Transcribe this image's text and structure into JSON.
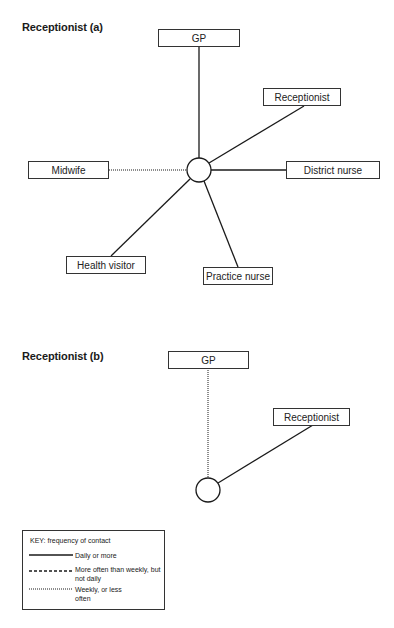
{
  "diagrams": [
    {
      "title": "Receptionist (a)",
      "nodes": [
        {
          "id": "gp",
          "label": "GP",
          "contact": "daily"
        },
        {
          "id": "receptionist",
          "label": "Receptionist",
          "contact": "daily"
        },
        {
          "id": "district_nurse",
          "label": "District nurse",
          "contact": "daily"
        },
        {
          "id": "practice_nurse",
          "label": "Practice nurse",
          "contact": "daily"
        },
        {
          "id": "health_visitor",
          "label": "Health visitor",
          "contact": "daily"
        },
        {
          "id": "midwife",
          "label": "Midwife",
          "contact": "weekly_or_less"
        }
      ]
    },
    {
      "title": "Receptionist (b)",
      "nodes": [
        {
          "id": "gp",
          "label": "GP",
          "contact": "weekly_or_less"
        },
        {
          "id": "receptionist",
          "label": "Receptionist",
          "contact": "daily"
        }
      ]
    }
  ],
  "key": {
    "title": "KEY: frequency of contact",
    "items": [
      {
        "style": "solid",
        "label": "Daily or more"
      },
      {
        "style": "dashed",
        "label": "More often than weekly, but not daily"
      },
      {
        "style": "dotted",
        "label": "Weekly, or less often"
      }
    ]
  },
  "colors": {
    "line": "#1a1a1a",
    "box_border": "#333333",
    "background": "#ffffff"
  }
}
